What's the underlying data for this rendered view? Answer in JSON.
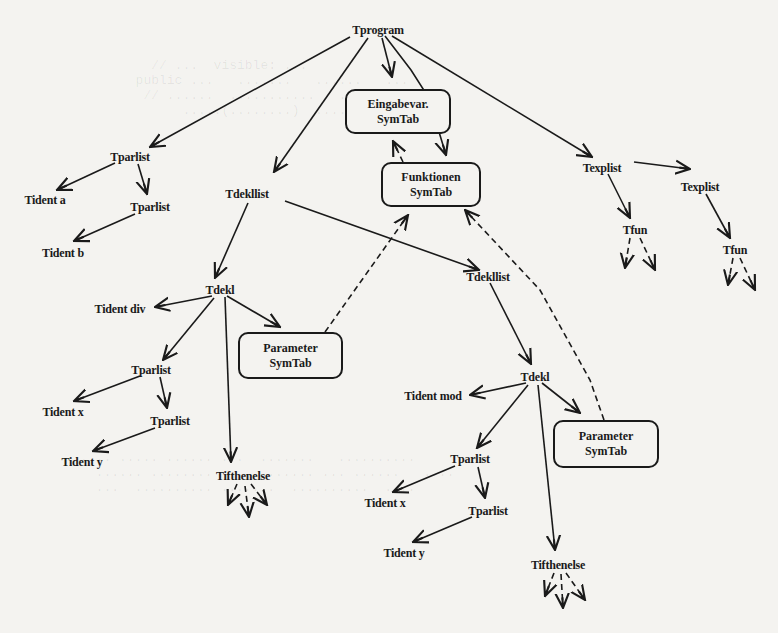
{
  "diagram": {
    "type": "syntax-tree-with-symbol-tables",
    "line_color": "#1a1a1a",
    "background": "#f4f3f0",
    "nodes": [
      {
        "id": "tprogram",
        "label": "Tprogram",
        "x": 378,
        "y": 30
      },
      {
        "id": "tparlist1",
        "label": "Tparlist",
        "x": 130,
        "y": 157
      },
      {
        "id": "tident_a",
        "label": "Tident a",
        "x": 45,
        "y": 200
      },
      {
        "id": "tparlist2",
        "label": "Tparlist",
        "x": 150,
        "y": 207
      },
      {
        "id": "tident_b",
        "label": "Tident b",
        "x": 63,
        "y": 253
      },
      {
        "id": "tdekllist1",
        "label": "Tdekllist",
        "x": 247,
        "y": 194
      },
      {
        "id": "tdekl1",
        "label": "Tdekl",
        "x": 220,
        "y": 290
      },
      {
        "id": "tident_div",
        "label": "Tident div",
        "x": 120,
        "y": 309
      },
      {
        "id": "tparlist3",
        "label": "Tparlist",
        "x": 151,
        "y": 370
      },
      {
        "id": "tident_x1",
        "label": "Tident x",
        "x": 63,
        "y": 412
      },
      {
        "id": "tparlist4",
        "label": "Tparlist",
        "x": 170,
        "y": 421
      },
      {
        "id": "tident_y1",
        "label": "Tident y",
        "x": 82,
        "y": 462
      },
      {
        "id": "tifthen1",
        "label": "Tifthenelse",
        "x": 243,
        "y": 476
      },
      {
        "id": "tdekllist2",
        "label": "Tdekllist",
        "x": 488,
        "y": 277
      },
      {
        "id": "tdekl2",
        "label": "Tdekl",
        "x": 535,
        "y": 377
      },
      {
        "id": "tident_mod",
        "label": "Tident mod",
        "x": 433,
        "y": 396
      },
      {
        "id": "tparlist5",
        "label": "Tparlist",
        "x": 470,
        "y": 459
      },
      {
        "id": "tident_x2",
        "label": "Tident x",
        "x": 385,
        "y": 503
      },
      {
        "id": "tparlist6",
        "label": "Tparlist",
        "x": 488,
        "y": 511
      },
      {
        "id": "tident_y2",
        "label": "Tident y",
        "x": 404,
        "y": 553
      },
      {
        "id": "tifthen2",
        "label": "Tifthenelse",
        "x": 558,
        "y": 565
      },
      {
        "id": "texplist1",
        "label": "Texplist",
        "x": 602,
        "y": 168
      },
      {
        "id": "texplist2",
        "label": "Texplist",
        "x": 700,
        "y": 187
      },
      {
        "id": "tfun1",
        "label": "Tfun",
        "x": 635,
        "y": 230
      },
      {
        "id": "tfun2",
        "label": "Tfun",
        "x": 735,
        "y": 250
      }
    ],
    "symtabs": [
      {
        "id": "eingabe",
        "line1": "Eingabevar.",
        "line2": "SymTab",
        "x": 345,
        "y": 89,
        "w": 106,
        "h": 45
      },
      {
        "id": "funktionen",
        "line1": "Funktionen",
        "line2": "SymTab",
        "x": 381,
        "y": 162,
        "w": 100,
        "h": 45
      },
      {
        "id": "param1",
        "line1": "Parameter",
        "line2": "SymTab",
        "x": 238,
        "y": 332,
        "w": 105,
        "h": 47
      },
      {
        "id": "param2",
        "line1": "Parameter",
        "line2": "SymTab",
        "x": 553,
        "y": 420,
        "w": 106,
        "h": 48
      }
    ],
    "edges_solid": [
      [
        350,
        37,
        150,
        147
      ],
      [
        368,
        38,
        274,
        172
      ],
      [
        382,
        38,
        392,
        77
      ],
      [
        385,
        36,
        411,
        70,
        427,
        95,
        436,
        122,
        446,
        155
      ],
      [
        392,
        36,
        592,
        157
      ],
      [
        115,
        163,
        57,
        190
      ],
      [
        138,
        164,
        147,
        194
      ],
      [
        135,
        214,
        74,
        241
      ],
      [
        248,
        203,
        215,
        278
      ],
      [
        285,
        201,
        479,
        270
      ],
      [
        212,
        296,
        155,
        307
      ],
      [
        214,
        298,
        163,
        360
      ],
      [
        225,
        297,
        231,
        462
      ],
      [
        227,
        296,
        280,
        327
      ],
      [
        140,
        376,
        74,
        401
      ],
      [
        160,
        377,
        167,
        408
      ],
      [
        155,
        428,
        93,
        451
      ],
      [
        490,
        283,
        531,
        364
      ],
      [
        526,
        383,
        470,
        395
      ],
      [
        528,
        385,
        477,
        448
      ],
      [
        538,
        385,
        555,
        550
      ],
      [
        542,
        383,
        580,
        413
      ],
      [
        455,
        466,
        393,
        492
      ],
      [
        478,
        467,
        485,
        498
      ],
      [
        472,
        517,
        413,
        542
      ],
      [
        608,
        174,
        630,
        218
      ],
      [
        634,
        162,
        690,
        169
      ],
      [
        706,
        194,
        730,
        238
      ]
    ],
    "edges_dashed": [
      [
        403,
        162,
        393,
        141
      ],
      [
        325,
        332,
        408,
        215
      ],
      [
        604,
        420,
        590,
        380,
        540,
        290,
        465,
        210
      ],
      [
        630,
        238,
        625,
        268
      ],
      [
        640,
        238,
        655,
        270
      ],
      [
        733,
        258,
        728,
        285
      ],
      [
        740,
        258,
        755,
        290
      ],
      [
        237,
        484,
        228,
        505
      ],
      [
        245,
        486,
        249,
        517
      ],
      [
        251,
        484,
        267,
        505
      ],
      [
        554,
        573,
        545,
        596
      ],
      [
        561,
        574,
        563,
        608
      ],
      [
        566,
        573,
        585,
        600
      ]
    ]
  }
}
